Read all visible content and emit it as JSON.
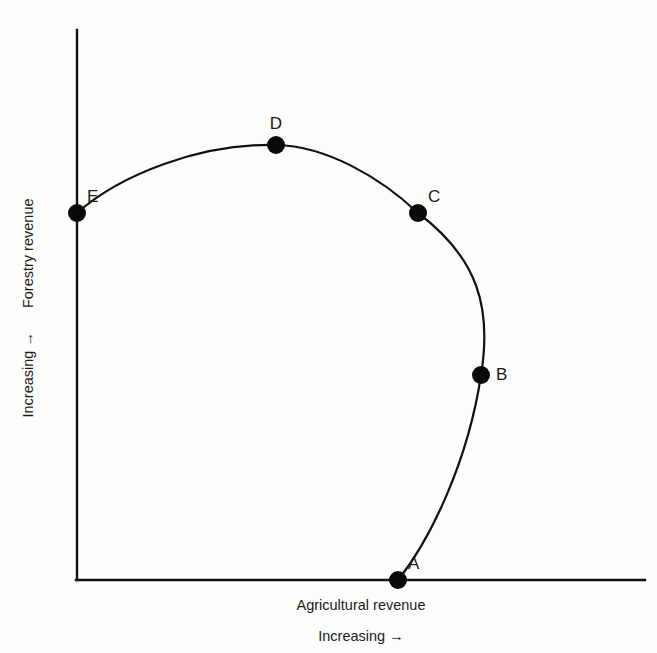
{
  "chart_data": {
    "type": "scatter",
    "title": "",
    "subtitle": "",
    "xlabel": "Agricultural revenue",
    "xlabel_sub": "Increasing →",
    "ylabel": "Forestry revenue",
    "ylabel_sub": "Increasing →",
    "grid": false,
    "legend": "none",
    "axis_ticks": "none",
    "xlim": [
      0,
      100
    ],
    "ylim": [
      0,
      100
    ],
    "curve_label": "production possibility frontier",
    "points": [
      {
        "label": "A",
        "x": 56.5,
        "y": 0.0,
        "px": 398,
        "py": 580,
        "label_pos": "right-above"
      },
      {
        "label": "B",
        "x": 71.1,
        "y": 37.3,
        "px": 481,
        "py": 375,
        "label_pos": "right"
      },
      {
        "label": "C",
        "x": 60.0,
        "y": 66.7,
        "px": 418,
        "py": 213,
        "label_pos": "right-above"
      },
      {
        "label": "D",
        "x": 35.0,
        "y": 79.1,
        "px": 276,
        "py": 145,
        "label_pos": "above"
      },
      {
        "label": "E",
        "x": 0.0,
        "y": 66.7,
        "px": 77,
        "py": 213,
        "label_pos": "right-above"
      }
    ],
    "series": [
      {
        "name": "frontier",
        "categories": [
          "A",
          "B",
          "C",
          "D",
          "E"
        ],
        "values": [
          0.0,
          37.3,
          66.7,
          79.1,
          66.7
        ],
        "x": [
          56.5,
          71.1,
          60.0,
          35.0,
          0.0
        ]
      }
    ]
  },
  "axes": {
    "x_axis_name": "x-axis",
    "y_axis_name": "y-axis",
    "origin_px": [
      77,
      580
    ],
    "x_end_px": [
      645,
      580
    ],
    "y_end_px": [
      77,
      30
    ]
  },
  "geometry": {
    "curve_path": "M 398 580 C 430 540, 468 462, 481 375 C 492 308, 478 258, 418 213 C 380 177, 326 146, 276 145 C 200 143, 120 175, 77 213",
    "dot_radius": 9.0,
    "dot_radius_small": 8.4
  }
}
